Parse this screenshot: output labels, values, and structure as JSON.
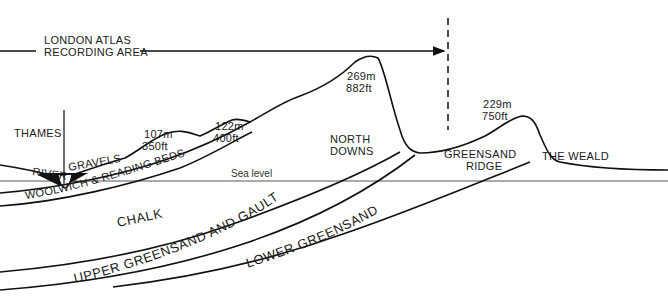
{
  "recording_area": {
    "line1": "LONDON ATLAS",
    "line2": "RECORDING AREA"
  },
  "features": {
    "thames": "THAMES",
    "river_gravels_1": "RIVER",
    "river_gravels_2": "GRAVELS",
    "north_downs_1": "NORTH",
    "north_downs_2": "DOWNS",
    "greensand_ridge_1": "GREENSAND",
    "greensand_ridge_2": "RIDGE",
    "the_weald": "THE WEALD",
    "sea_level": "Sea level"
  },
  "elevations": [
    {
      "metres": "107m",
      "feet": "350ft"
    },
    {
      "metres": "122m",
      "feet": "400ft"
    },
    {
      "metres": "269m",
      "feet": "882ft"
    },
    {
      "metres": "229m",
      "feet": "750ft"
    }
  ],
  "strata": {
    "woolwich": "WOOLWICH & READING BEDS",
    "chalk": "CHALK",
    "upper_greensand": "UPPER GREENSAND AND GAULT",
    "lower_greensand": "LOWER GREENSAND"
  },
  "colors": {
    "ink": "#111111",
    "background": "#ffffff"
  }
}
